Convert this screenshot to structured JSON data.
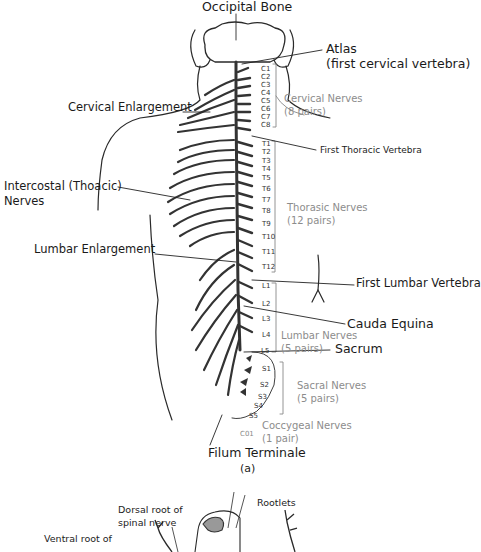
{
  "figure": {
    "panel_a_label": "(a)",
    "labels": {
      "occipital_bone": "Occipital Bone",
      "atlas_line1": "Atlas",
      "atlas_line2": "(first cervical vertebra)",
      "cervical_enlargement": "Cervical Enlargement",
      "first_thoracic_vertebra": "First Thoracic Vertebra",
      "intercostal_line1": "Intercostal (Thoacic)",
      "intercostal_line2": "Nerves",
      "lumbar_enlargement": "Lumbar Enlargement",
      "first_lumbar_vertebra": "First Lumbar Vertebra",
      "cauda_equina": "Cauda Equina",
      "sacrum": "Sacrum",
      "filum_terminale": "Filum Terminale"
    },
    "nerve_groups": {
      "cervical": {
        "name": "Cervical Nerves",
        "count": "(8 pairs)"
      },
      "thoracic": {
        "name": "Thorasic Nerves",
        "count": "(12 pairs)"
      },
      "lumbar": {
        "name": "Lumbar Nerves",
        "count": "(5 pairs)"
      },
      "sacral": {
        "name": "Sacral Nerves",
        "count": "(5 pairs)"
      },
      "coccygeal": {
        "name": "Coccygeal Nerves",
        "count": "(1 pair)"
      }
    },
    "segments": {
      "cervical": [
        "C1",
        "C2",
        "C3",
        "C4",
        "C5",
        "C6",
        "C7",
        "C8"
      ],
      "thoracic": [
        "T1",
        "T2",
        "T3",
        "T4",
        "T5",
        "T6",
        "T7",
        "T8",
        "T9",
        "T10",
        "T11",
        "T12"
      ],
      "lumbar": [
        "L1",
        "L2",
        "L3",
        "L4",
        "L5"
      ],
      "sacral": [
        "S1",
        "S2",
        "S3",
        "S4",
        "S5"
      ],
      "coccygeal": [
        "C01"
      ]
    },
    "panel_b": {
      "rootlets": "Rootlets",
      "dorsal_root_line1": "Dorsal root of",
      "dorsal_root_line2": "spinal nerve",
      "ventral_root_line1": "Ventral root of"
    }
  }
}
